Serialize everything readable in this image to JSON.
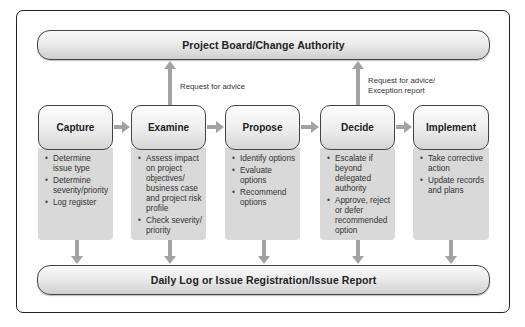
{
  "top_bar": {
    "label": "Project Board/Change Authority"
  },
  "bottom_bar": {
    "label": "Daily Log or Issue Registration/Issue Report"
  },
  "annotations": {
    "examine_to_board": "Request for advice",
    "decide_to_board_line1": "Request for advice/",
    "decide_to_board_line2": "Exception report"
  },
  "stages": [
    {
      "title": "Capture",
      "items": [
        "Determine issue type",
        "Determine severity/priority",
        "Log register"
      ]
    },
    {
      "title": "Examine",
      "items": [
        "Assess impact on project objectives/ business case and project risk profile",
        "Check severity/ priority"
      ]
    },
    {
      "title": "Propose",
      "items": [
        "Identify options",
        "Evaluate options",
        "Recommend options"
      ]
    },
    {
      "title": "Decide",
      "items": [
        "Escalate if beyond delegated authority",
        "Approve, reject or defer recommended option"
      ]
    },
    {
      "title": "Implement",
      "items": [
        "Take corrective action",
        "Update records and plans"
      ]
    }
  ],
  "colors": {
    "arrow": "#a3a3a3",
    "panel": "#d9d9d9",
    "border": "#444444"
  }
}
